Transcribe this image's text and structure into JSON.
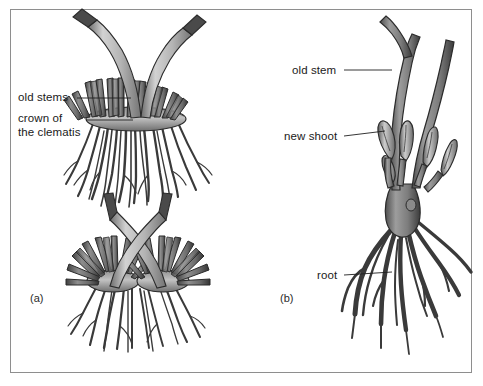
{
  "figure": {
    "background_color": "#ffffff",
    "frame_color": "#8e8e8e"
  },
  "palette": {
    "stem_light": "#c9c9c9",
    "stem_mid": "#9a9a9a",
    "stem_dark": "#5a5a5a",
    "cut_tip": "#4a4a4a",
    "outline": "#2b2b2b",
    "root": "#3a3a3a",
    "leader_line": "#1f1f1f",
    "text": "#1a1a1a"
  },
  "panels": [
    {
      "id": "panel-a",
      "label": "(a)",
      "label_x": 30,
      "label_y": 302,
      "description": "Two clematis plants showing the crown of the clematis with old stems and fibrous roots"
    },
    {
      "id": "panel-b",
      "label": "(b)",
      "label_x": 280,
      "label_y": 302,
      "description": "Clematis rootstock showing old stem, new shoot and thick roots"
    }
  ],
  "labels": [
    {
      "id": "old-stems",
      "text": "old stems",
      "text_x": 18,
      "text_y": 101,
      "leader_from_x": 77,
      "leader_from_y": 98,
      "leader_to_x": 131,
      "leader_to_y": 98
    },
    {
      "id": "crown-of-the-clematis",
      "text_line_1": "crown of",
      "text_line_2": "the clematis",
      "text_x": 18,
      "text_y": 122,
      "text_y2": 136,
      "leader_from_x": 86,
      "leader_from_y": 120,
      "leader_to_x": 133,
      "leader_to_y": 120
    },
    {
      "id": "old-stem",
      "text": "old stem",
      "text_x": 292,
      "text_y": 74,
      "leader_from_x": 344,
      "leader_from_y": 70,
      "leader_to_x": 392,
      "leader_to_y": 70
    },
    {
      "id": "new-shoot",
      "text": "new shoot",
      "text_x": 284,
      "text_y": 140,
      "leader_from_x": 344,
      "leader_from_y": 136,
      "leader_to_x": 385,
      "leader_to_y": 131
    },
    {
      "id": "root",
      "text": "root",
      "text_x": 317,
      "text_y": 279,
      "leader_from_x": 344,
      "leader_from_y": 275,
      "leader_to_x": 392,
      "leader_to_y": 272
    }
  ],
  "diagram_parts": {
    "panel_a_top": {
      "name": "clematis-plant-single-crown",
      "stems": 2,
      "stem_arrangement": "v-shape",
      "crown_type": "single wide crown",
      "crown_stubs": 17,
      "roots": "dense fibrous root mass"
    },
    "panel_a_bottom": {
      "name": "clematis-plant-split-crown",
      "stems": 2,
      "stem_arrangement": "crossed x-shape",
      "crown_type": "two separate crowns",
      "crown_stubs": 20,
      "roots": "two fibrous root clusters"
    },
    "panel_b": {
      "name": "clematis-rootstock",
      "old_stems": 2,
      "new_shoots": 5,
      "roots": "thick tapering roots"
    }
  }
}
